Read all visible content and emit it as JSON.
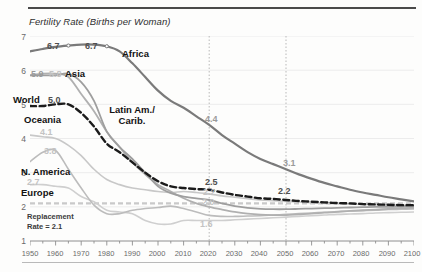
{
  "figure": {
    "title": "Fertility Rate (Births per Woman)"
  },
  "axis": {
    "y_ticks": [
      "7",
      "6",
      "5",
      "4",
      "3",
      "2",
      "1"
    ],
    "x_ticks": [
      "1950",
      "1960",
      "1970",
      "1980",
      "1990",
      "2000",
      "2010",
      "2020",
      "2030",
      "2040",
      "2050",
      "2060",
      "2070",
      "2080",
      "2090",
      "2100"
    ]
  },
  "annotations": {
    "replacement_line1": "Replacement",
    "replacement_line2": "Rate = 2.1",
    "label_africa": "Africa",
    "label_asia": "Asia",
    "label_world": "World",
    "label_oceania": "Oceania",
    "label_latam_line1": "Latin Am./",
    "label_latam_line2": "Carib.",
    "label_namerica": "N. America",
    "label_europe": "Europe",
    "v_africa_1965": "6.7",
    "v_africa_1980": "6.7",
    "v_asia_1965": "5.9",
    "v_latam_1965": "5.8",
    "v_world_1965": "5.0",
    "v_oceania_1950": "4.1",
    "v_oceania_1965": "3.8",
    "v_namerica_1960": "2.7",
    "v_africa_2020": "4.4",
    "v_africa_2050": "3.1",
    "v_world_2020": "2.5",
    "v_world_2050": "2.2",
    "v_asia_2020": "2.2",
    "v_latam_2020": "2.0",
    "v_europe_2020": "1.6"
  },
  "colors": {
    "africa": "#7a7a7a",
    "world": "#1b1b1b",
    "asia": "#9e9e9e",
    "latam": "#b0b0b0",
    "oceania": "#c8c8c8",
    "namerica": "#bcbcbc",
    "europe": "#cfcfcf",
    "replacement": "#c9c9c9",
    "grid": "#ececec",
    "marker_line": "#b9b9b9"
  },
  "chart_data": {
    "type": "line",
    "title": "Fertility Rate (Births per Woman)",
    "xlabel": "",
    "ylabel": "Births per Woman",
    "xlim": [
      1950,
      2100
    ],
    "ylim": [
      1,
      7
    ],
    "grid": true,
    "legend": "inline-labels",
    "replacement_rate": 2.1,
    "projection_markers": [
      2020,
      2050
    ],
    "x": [
      1950,
      1955,
      1960,
      1965,
      1970,
      1975,
      1980,
      1985,
      1990,
      1995,
      2000,
      2005,
      2010,
      2015,
      2020,
      2025,
      2030,
      2035,
      2040,
      2045,
      2050,
      2055,
      2060,
      2065,
      2070,
      2075,
      2080,
      2085,
      2090,
      2095,
      2100
    ],
    "series": [
      {
        "name": "Africa",
        "values": [
          6.55,
          6.62,
          6.68,
          6.72,
          6.75,
          6.75,
          6.7,
          6.55,
          6.2,
          5.8,
          5.4,
          5.1,
          4.9,
          4.65,
          4.4,
          4.1,
          3.85,
          3.6,
          3.4,
          3.25,
          3.1,
          2.95,
          2.82,
          2.7,
          2.6,
          2.5,
          2.42,
          2.35,
          2.28,
          2.22,
          2.16
        ]
      },
      {
        "name": "Asia",
        "values": [
          5.85,
          5.85,
          5.85,
          5.9,
          5.65,
          5.1,
          4.2,
          3.75,
          3.4,
          3.0,
          2.6,
          2.4,
          2.3,
          2.25,
          2.2,
          2.1,
          2.02,
          1.97,
          1.94,
          1.93,
          1.93,
          1.94,
          1.95,
          1.96,
          1.97,
          1.98,
          1.99,
          2.0,
          2.0,
          2.01,
          2.02
        ]
      },
      {
        "name": "Latin Am./Carib.",
        "values": [
          5.85,
          5.9,
          5.9,
          5.8,
          5.3,
          4.8,
          4.2,
          3.75,
          3.3,
          2.95,
          2.65,
          2.45,
          2.25,
          2.1,
          2.0,
          1.92,
          1.85,
          1.8,
          1.77,
          1.76,
          1.76,
          1.78,
          1.8,
          1.83,
          1.85,
          1.88,
          1.9,
          1.92,
          1.94,
          1.96,
          1.97
        ]
      },
      {
        "name": "World",
        "values": [
          4.95,
          4.95,
          5.0,
          5.0,
          4.75,
          4.35,
          3.85,
          3.6,
          3.3,
          3.0,
          2.75,
          2.6,
          2.55,
          2.52,
          2.5,
          2.42,
          2.35,
          2.3,
          2.25,
          2.23,
          2.2,
          2.17,
          2.15,
          2.13,
          2.11,
          2.1,
          2.08,
          2.07,
          2.06,
          2.05,
          2.05
        ]
      },
      {
        "name": "Oceania",
        "values": [
          4.1,
          4.05,
          4.0,
          3.8,
          3.5,
          3.1,
          2.8,
          2.65,
          2.55,
          2.5,
          2.45,
          2.42,
          2.45,
          2.42,
          2.38,
          2.32,
          2.28,
          2.24,
          2.2,
          2.18,
          2.16,
          2.14,
          2.12,
          2.1,
          2.09,
          2.08,
          2.07,
          2.06,
          2.05,
          2.05,
          2.04
        ]
      },
      {
        "name": "N. America",
        "values": [
          3.32,
          3.6,
          3.65,
          3.1,
          2.55,
          2.05,
          1.8,
          1.8,
          1.9,
          1.95,
          1.98,
          2.02,
          1.95,
          1.85,
          1.75,
          1.72,
          1.72,
          1.73,
          1.74,
          1.76,
          1.78,
          1.8,
          1.82,
          1.84,
          1.86,
          1.88,
          1.89,
          1.9,
          1.92,
          1.93,
          1.94
        ]
      },
      {
        "name": "Europe",
        "values": [
          2.65,
          2.65,
          2.6,
          2.55,
          2.3,
          2.15,
          1.9,
          1.85,
          1.8,
          1.6,
          1.5,
          1.5,
          1.6,
          1.6,
          1.6,
          1.6,
          1.62,
          1.64,
          1.66,
          1.68,
          1.7,
          1.72,
          1.74,
          1.76,
          1.78,
          1.79,
          1.8,
          1.82,
          1.83,
          1.84,
          1.85
        ]
      }
    ]
  }
}
